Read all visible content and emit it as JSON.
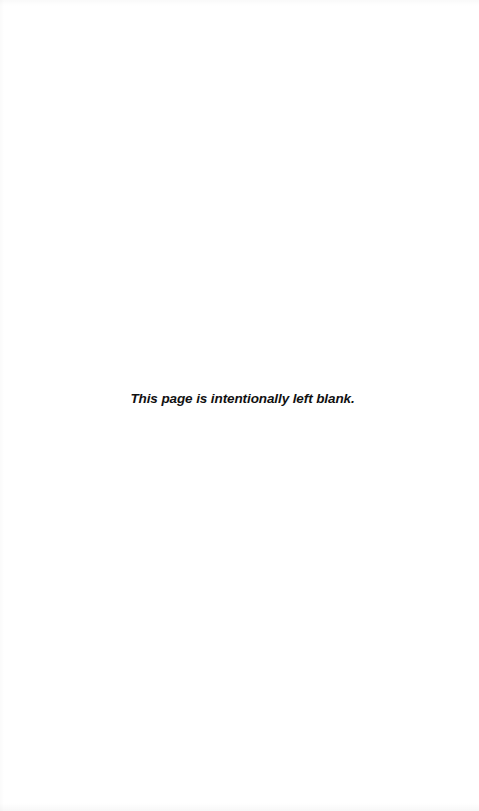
{
  "page": {
    "notice": "This page is intentionally left blank.",
    "background_color": "#ffffff",
    "text_color": "#111111"
  }
}
